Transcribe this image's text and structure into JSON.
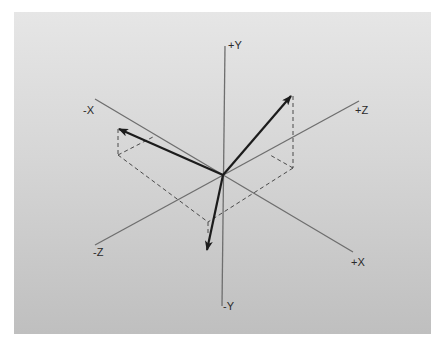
{
  "diagram": {
    "title": "",
    "background": {
      "top": "#e6e6e6",
      "bottom": "#bfbfbf"
    },
    "colors": {
      "axis": "#6e6e6e",
      "vector": "#1c1c1c",
      "dashed": "#4a4a4a"
    },
    "axes": {
      "plus_y": "+Y",
      "minus_y": "-Y",
      "plus_x": "+X",
      "minus_x": "-X",
      "plus_z": "+Z",
      "minus_z": "-Z"
    },
    "vectors": [
      {
        "name": "vector-up-right",
        "direction": "toward +Y / +Z"
      },
      {
        "name": "vector-up-left",
        "direction": "toward +Y / -X"
      },
      {
        "name": "vector-down",
        "direction": "toward -Y"
      }
    ]
  }
}
